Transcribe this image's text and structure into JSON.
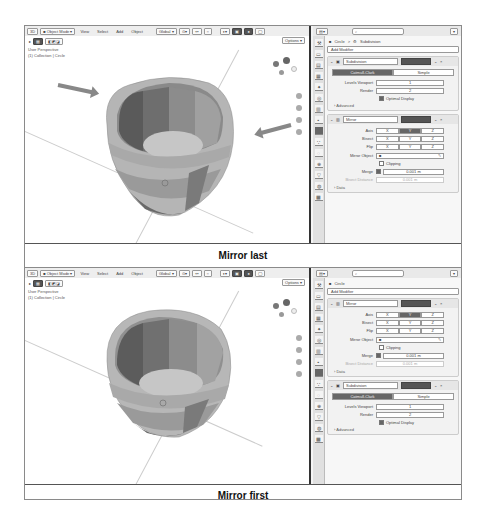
{
  "panels": [
    {
      "caption": "Mirror last",
      "toolbar": {
        "editor_type": "3D",
        "mode": "Object Mode",
        "menus": [
          "View",
          "Select",
          "Add",
          "Object"
        ],
        "transform_orientation": "Global",
        "options": "Options"
      },
      "overlay": {
        "line1": "User Perspective",
        "line2": "(1) Collection | Circle"
      },
      "properties": {
        "search_placeholder": "",
        "breadcrumb_object": "Circle",
        "breadcrumb_sep": ">",
        "breadcrumb_modifier": "Subdivision",
        "add_modifier": "Add Modifier",
        "modifiers": [
          {
            "type": "subdivision",
            "name": "Subdivision",
            "seg_options": [
              "Catmull-Clark",
              "Simple"
            ],
            "levels_viewport_label": "Levels Viewport",
            "levels_viewport": "1",
            "render_label": "Render",
            "render": "2",
            "optimal_display": "Optimal Display",
            "advanced": "Advanced"
          },
          {
            "type": "mirror",
            "name": "Mirror",
            "axis_label": "Axis",
            "bisect_label": "Bisect",
            "flip_label": "Flip",
            "axes": [
              "X",
              "Y",
              "Z"
            ],
            "mirror_object_label": "Mirror Object",
            "clipping": "Clipping",
            "merge_label": "Merge",
            "merge_value": "0.001 m",
            "bisect_distance_label": "Bisect Distance",
            "bisect_distance": "0.001 m",
            "data": "Data"
          }
        ]
      },
      "arrows": 2
    },
    {
      "caption": "Mirror first",
      "toolbar": {
        "editor_type": "3D",
        "mode": "Object Mode",
        "menus": [
          "View",
          "Select",
          "Add",
          "Object"
        ],
        "transform_orientation": "Global",
        "options": "Options"
      },
      "overlay": {
        "line1": "User Perspective",
        "line2": "(1) Collection | Circle"
      },
      "properties": {
        "search_placeholder": "",
        "breadcrumb_object": "Circle",
        "add_modifier": "Add Modifier",
        "modifiers": [
          {
            "type": "mirror",
            "name": "Mirror",
            "axis_label": "Axis",
            "bisect_label": "Bisect",
            "flip_label": "Flip",
            "axes": [
              "X",
              "Y",
              "Z"
            ],
            "mirror_object_label": "Mirror Object",
            "clipping": "Clipping",
            "merge_label": "Merge",
            "merge_value": "0.001 m",
            "bisect_distance_label": "Bisect Distance",
            "bisect_distance": "0.001 m",
            "data": "Data"
          },
          {
            "type": "subdivision",
            "name": "Subdivision",
            "seg_options": [
              "Catmull-Clark",
              "Simple"
            ],
            "levels_viewport_label": "Levels Viewport",
            "levels_viewport": "1",
            "render_label": "Render",
            "render": "2",
            "optimal_display": "Optimal Display",
            "advanced": "Advanced"
          }
        ]
      }
    }
  ],
  "colors": {
    "mesh_light": "#bdbdbd",
    "mesh_mid": "#9a9a9a",
    "mesh_dark": "#5e5e5e",
    "active_button": "#666666",
    "arrow": "#888888"
  }
}
